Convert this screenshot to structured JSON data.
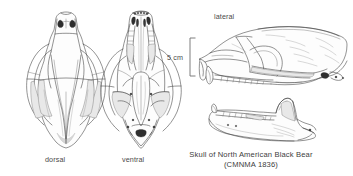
{
  "figure": {
    "type": "scientific-illustration",
    "background_color": "#ffffff",
    "ink_color": "#3a3a3a",
    "width": 353,
    "height": 176
  },
  "views": [
    {
      "id": "dorsal",
      "label": "dorsal",
      "description": "cranium seen from above, nasal aperture and sagittal crest visible"
    },
    {
      "id": "ventral",
      "label": "ventral",
      "description": "cranium seen from below, tooth rows, palate and foramen magnum visible"
    },
    {
      "id": "lateral",
      "label": "lateral",
      "description": "cranium in left side view above the separated mandible"
    }
  ],
  "scale": {
    "label": "5 cm",
    "bracket": "left-square-bracket"
  },
  "caption": {
    "line1": "Skull of North American Black Bear",
    "line2": "(CMNMA 1836)"
  }
}
